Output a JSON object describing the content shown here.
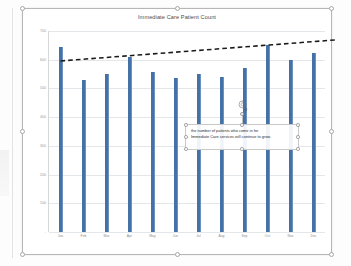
{
  "chart": {
    "title": "Immediate Care Patient Count",
    "bar_color": "#4472a8",
    "trendline_color": "#1a1a1a",
    "gridline_color": "#e4e7ea"
  },
  "textbox": {
    "line1": "the number of patients who come in for",
    "line2": "Immediate Care services will continue to grow.",
    "rotate_icon": "rotate-handle-icon"
  },
  "chart_data": {
    "type": "bar",
    "title": "Immediate Care Patient Count",
    "xlabel": "",
    "ylabel": "",
    "ylim": [
      0,
      700
    ],
    "yticks": [
      0,
      100,
      200,
      300,
      400,
      500,
      600,
      700
    ],
    "ytick_labels": [
      "-",
      "100",
      "200",
      "300",
      "400",
      "500",
      "600",
      "700"
    ],
    "grid": true,
    "legend": "none",
    "categories": [
      "Jan",
      "Feb",
      "Mar",
      "Apr",
      "May",
      "Jun",
      "Jul",
      "Aug",
      "Sep",
      "Oct",
      "Nov",
      "Dec"
    ],
    "values": [
      645,
      530,
      550,
      610,
      558,
      535,
      550,
      540,
      570,
      650,
      600,
      625
    ],
    "series": [
      {
        "name": "Patient Count",
        "values": [
          645,
          530,
          550,
          610,
          558,
          535,
          550,
          540,
          570,
          650,
          600,
          625
        ]
      }
    ],
    "annotations": [
      {
        "type": "trendline",
        "style": "dashed",
        "color": "#1a1a1a",
        "start_value": 548,
        "end_value": 655,
        "extends_past_data": true
      }
    ]
  }
}
